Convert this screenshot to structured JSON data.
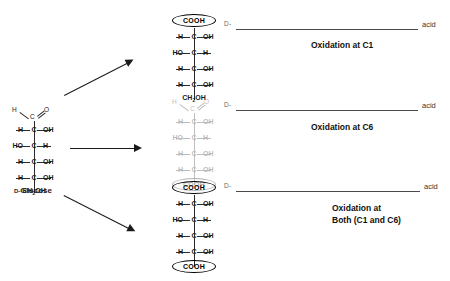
{
  "diagram": {
    "reactant": {
      "name_prefix": "D-",
      "name": "Glucose",
      "top_group": {
        "h": "H",
        "c": "C",
        "o": "O"
      },
      "stereocenters": [
        {
          "left": "H",
          "center": "C",
          "right": "OH"
        },
        {
          "left": "HO",
          "center": "C",
          "right": "H"
        },
        {
          "left": "H",
          "center": "C",
          "right": "OH"
        },
        {
          "left": "H",
          "center": "C",
          "right": "OH"
        }
      ],
      "bottom_group": "CH2OH"
    },
    "arrows": [
      {
        "name": "arrow-to-c1-product"
      },
      {
        "name": "arrow-to-c6-product"
      },
      {
        "name": "arrow-to-both-product"
      }
    ],
    "products": [
      {
        "id": "oxidation-c1",
        "top_group_text": "COOH",
        "top_circled": true,
        "top_is_aldehyde": false,
        "stereocenters": [
          {
            "left": "H",
            "center": "C",
            "right": "OH"
          },
          {
            "left": "HO",
            "center": "C",
            "right": "H"
          },
          {
            "left": "H",
            "center": "C",
            "right": "OH"
          },
          {
            "left": "H",
            "center": "C",
            "right": "OH"
          }
        ],
        "bottom_group_text": "CH2OH",
        "bottom_circled": false,
        "faded": false,
        "label": {
          "prefix": "D-",
          "blank": "",
          "suffix": "acid"
        },
        "caption": "Oxidation at C1"
      },
      {
        "id": "oxidation-c6",
        "top_group_text": "CHO",
        "top_circled": false,
        "top_is_aldehyde": true,
        "stereocenters": [
          {
            "left": "H",
            "center": "C",
            "right": "OH"
          },
          {
            "left": "HO",
            "center": "C",
            "right": "H"
          },
          {
            "left": "H",
            "center": "C",
            "right": "OH"
          },
          {
            "left": "H",
            "center": "C",
            "right": "OH"
          }
        ],
        "bottom_group_text": "COOH",
        "bottom_circled": true,
        "faded": true,
        "label": {
          "prefix": "D-",
          "blank": "",
          "suffix": "acid"
        },
        "caption": "Oxidation at C6"
      },
      {
        "id": "oxidation-both",
        "top_group_text": "COOH",
        "top_circled": true,
        "top_is_aldehyde": false,
        "stereocenters": [
          {
            "left": "H",
            "center": "C",
            "right": "OH"
          },
          {
            "left": "HO",
            "center": "C",
            "right": "H"
          },
          {
            "left": "H",
            "center": "C",
            "right": "OH"
          },
          {
            "left": "H",
            "center": "C",
            "right": "OH"
          }
        ],
        "bottom_group_text": "COOH",
        "bottom_circled": true,
        "faded": false,
        "label": {
          "prefix": "D-",
          "blank": "",
          "suffix": "acid"
        },
        "caption": "Oxidation at\nBoth (C1 and C6)"
      }
    ],
    "colors": {
      "ink": "#1a1a1a",
      "bond": "#2a2a2a",
      "blank_line": "#4a4a4a",
      "background": "#ffffff"
    }
  }
}
